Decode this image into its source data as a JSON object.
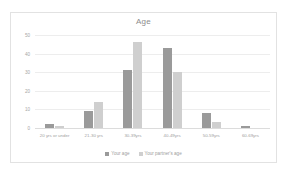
{
  "chart_data": {
    "type": "bar",
    "title": "Age",
    "xlabel": "",
    "ylabel": "",
    "ylim": [
      0,
      50
    ],
    "yticks": [
      0,
      10,
      20,
      30,
      40,
      50
    ],
    "grid": true,
    "legend_position": "bottom",
    "categories": [
      "20 yrs or under",
      "21-30 yrs",
      "30-39yrs",
      "40-49yrs",
      "50-59yrs",
      "60-69yrs"
    ],
    "series": [
      {
        "name": "Your age",
        "color": "#9a9a9a",
        "values": [
          2,
          9,
          31,
          43,
          8,
          1
        ]
      },
      {
        "name": "Your partner's age",
        "color": "#cfcfcf",
        "values": [
          1,
          14,
          46,
          30,
          3,
          0
        ]
      }
    ]
  }
}
